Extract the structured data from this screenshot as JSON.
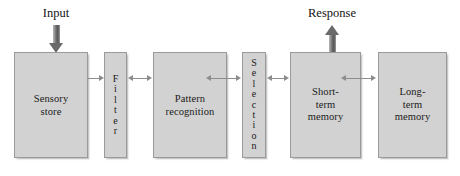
{
  "diagram": {
    "type": "information-processing-model",
    "background_color": "#ffffff",
    "box_fill_color": "#d2d2d2",
    "box_border_color": "#9a9a9a",
    "connector_color": "#8d8d8d",
    "block_arrow_color": "#6a6a6a",
    "captions": {
      "input": "Input",
      "response": "Response"
    },
    "stages": [
      {
        "id": "sensory-store",
        "label": "Sensory\nstore",
        "orientation": "horizontal"
      },
      {
        "id": "filter",
        "label": "F\ni\nl\nt\ne\nr",
        "orientation": "vertical"
      },
      {
        "id": "pattern-recognition",
        "label": "Pattern\nrecognition",
        "orientation": "horizontal"
      },
      {
        "id": "selection",
        "label": "S\ne\nl\ne\nc\nt\ni\no\nn",
        "orientation": "vertical"
      },
      {
        "id": "short-term-memory",
        "label": "Short-\nterm\nmemory",
        "orientation": "horizontal"
      },
      {
        "id": "long-term-memory",
        "label": "Long-\nterm\nmemory",
        "orientation": "horizontal"
      }
    ]
  }
}
